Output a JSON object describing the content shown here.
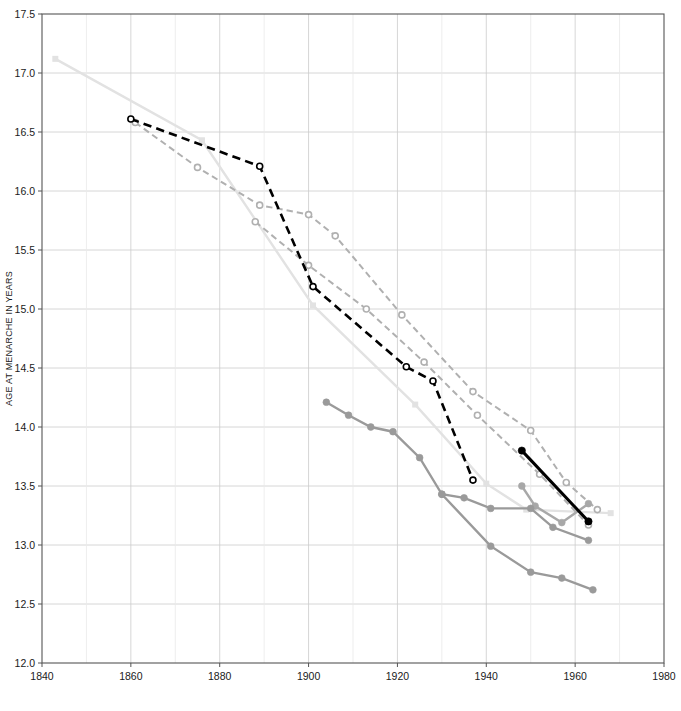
{
  "chart_data": {
    "type": "line",
    "title": "",
    "xlabel": "",
    "ylabel": "AGE AT MENARCHE IN YEARS",
    "xlim": [
      1840,
      1980
    ],
    "ylim": [
      12.0,
      17.5
    ],
    "xticks": [
      1840,
      1860,
      1880,
      1900,
      1920,
      1940,
      1960,
      1980
    ],
    "xticklabels": [
      "1840",
      "1860",
      "1880",
      "1900",
      "1920",
      "1940",
      "1960",
      "1980"
    ],
    "yticks": [
      12.0,
      12.5,
      13.0,
      13.5,
      14.0,
      14.5,
      15.0,
      15.5,
      16.0,
      16.5,
      17.0,
      17.5
    ],
    "yticklabels": [
      "12.0",
      "12.5",
      "13.0",
      "13.5",
      "14.0",
      "14.5",
      "15.0",
      "15.5",
      "16.0",
      "16.5",
      "17.0",
      "17.5"
    ],
    "x_minor_ticks": [
      1850,
      1870,
      1890,
      1910,
      1930,
      1950,
      1970
    ],
    "grid": true,
    "grid_color": "#cccccc",
    "legend": "none",
    "series": [
      {
        "name": "series-black-dashed-open",
        "color": "#000000",
        "linestyle": "dashed",
        "linewidth": 2.6,
        "marker": "open-circle",
        "marker_size": 6,
        "x": [
          1860,
          1889,
          1901,
          1922,
          1928,
          1937
        ],
        "y": [
          16.61,
          16.21,
          15.19,
          14.51,
          14.39,
          13.55
        ]
      },
      {
        "name": "series-gray-dashed-open-upper",
        "color": "#b0b0b0",
        "linestyle": "dashed",
        "linewidth": 2.0,
        "marker": "open-circle",
        "marker_size": 6,
        "x": [
          1861,
          1875,
          1889,
          1900,
          1906,
          1921,
          1937,
          1950,
          1958,
          1965
        ],
        "y": [
          16.58,
          16.2,
          15.88,
          15.8,
          15.62,
          14.95,
          14.3,
          13.97,
          13.53,
          13.3
        ]
      },
      {
        "name": "series-gray-dashed-open-lower",
        "color": "#b0b0b0",
        "linestyle": "dashed",
        "linewidth": 2.0,
        "marker": "open-circle",
        "marker_size": 6,
        "x": [
          1888,
          1900,
          1913,
          1926,
          1938,
          1952,
          1963
        ],
        "y": [
          15.74,
          15.37,
          15.0,
          14.55,
          14.1,
          13.6,
          13.17
        ]
      },
      {
        "name": "series-lightest-solid-square",
        "color": "#e2e2e2",
        "linestyle": "solid",
        "linewidth": 2.4,
        "marker": "filled-square",
        "marker_size": 6,
        "x": [
          1843,
          1876,
          1901,
          1924,
          1940,
          1949,
          1968
        ],
        "y": [
          17.12,
          16.43,
          15.03,
          14.19,
          13.52,
          13.3,
          13.27
        ]
      },
      {
        "name": "series-medium-gray-solid-filled-upper",
        "color": "#9a9a9a",
        "linestyle": "solid",
        "linewidth": 2.4,
        "marker": "filled-circle",
        "marker_size": 6,
        "x": [
          1904,
          1909,
          1914,
          1919,
          1925,
          1930,
          1935,
          1941,
          1950,
          1955,
          1963
        ],
        "y": [
          14.21,
          14.1,
          14.0,
          13.96,
          13.74,
          13.43,
          13.4,
          13.31,
          13.31,
          13.15,
          13.04
        ]
      },
      {
        "name": "series-medium-gray-solid-filled-lower",
        "color": "#9a9a9a",
        "linestyle": "solid",
        "linewidth": 2.4,
        "marker": "filled-circle",
        "marker_size": 6,
        "x": [
          1930,
          1941,
          1950,
          1957,
          1964
        ],
        "y": [
          13.43,
          12.99,
          12.77,
          12.72,
          12.62
        ]
      },
      {
        "name": "series-light-gray-solid-filled-right",
        "color": "#a8a8a8",
        "linestyle": "solid",
        "linewidth": 2.4,
        "marker": "filled-circle",
        "marker_size": 6,
        "x": [
          1948,
          1951,
          1957,
          1963
        ],
        "y": [
          13.5,
          13.33,
          13.19,
          13.35
        ]
      },
      {
        "name": "series-black-solid-filled",
        "color": "#000000",
        "linestyle": "solid",
        "linewidth": 3.0,
        "marker": "filled-circle",
        "marker_size": 6.5,
        "x": [
          1948,
          1963
        ],
        "y": [
          13.8,
          13.2
        ]
      }
    ]
  }
}
